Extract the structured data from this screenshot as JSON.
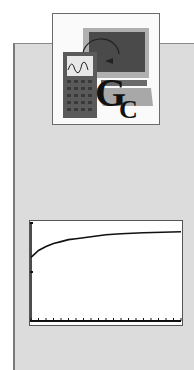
{
  "logo": {
    "name": "graphing-calculator-logo",
    "letters": [
      "G",
      "C"
    ],
    "colors": {
      "screen": "#4a4a4a",
      "calculator": "#5a5a5a",
      "base": "#a0a0a0",
      "letter": "#111111"
    }
  },
  "chart_data": {
    "type": "line",
    "title": "",
    "xlabel": "",
    "ylabel": "",
    "grid": false,
    "x": [
      0,
      1,
      2,
      3,
      4,
      5,
      6,
      7,
      8,
      9,
      10,
      12,
      15,
      20
    ],
    "series": [
      {
        "name": "curve",
        "values": [
          0.65,
          0.72,
          0.76,
          0.79,
          0.81,
          0.83,
          0.84,
          0.85,
          0.86,
          0.87,
          0.88,
          0.89,
          0.9,
          0.91
        ]
      }
    ],
    "xlim": [
      0,
      20
    ],
    "ylim": [
      0,
      1
    ],
    "x_ticks": 20,
    "y_ticks": [
      0,
      0.5,
      1
    ]
  }
}
